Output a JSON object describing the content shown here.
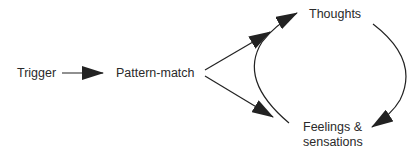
{
  "diagram": {
    "nodes": [
      {
        "id": "trigger",
        "label": "Trigger"
      },
      {
        "id": "pattern_match",
        "label": "Pattern-match"
      },
      {
        "id": "thoughts",
        "label": "Thoughts"
      },
      {
        "id": "feelings",
        "label_line1": "Feelings &",
        "label_line2": "sensations"
      }
    ],
    "edges": [
      {
        "from": "trigger",
        "to": "pattern_match",
        "style": "straight-arrow"
      },
      {
        "from": "pattern_match",
        "to": "thoughts",
        "style": "straight-arrow"
      },
      {
        "from": "pattern_match",
        "to": "feelings",
        "style": "straight-arrow"
      },
      {
        "from": "feelings",
        "to": "thoughts",
        "style": "curved-arrow-left-arc"
      },
      {
        "from": "thoughts",
        "to": "feelings",
        "style": "curved-arrow-right-arc"
      }
    ],
    "colors": {
      "stroke": "#222222",
      "text": "#2a2a2a",
      "background": "#ffffff"
    }
  }
}
